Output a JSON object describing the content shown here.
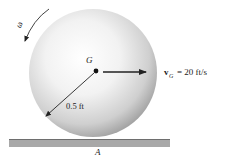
{
  "diagram": {
    "type": "rolling-sphere-kinematics",
    "labels": {
      "omega": "ω",
      "center": "G",
      "radius": "0.5 ft",
      "velocity_symbol": "v",
      "velocity_subscript": "G",
      "velocity_value": "= 20 ft/s",
      "contact_point": "A"
    },
    "colors": {
      "sphere_highlight": "#ffffff",
      "sphere_shadow": "#9a9a9a",
      "ground": "#a8a8a8",
      "ground_edge": "#6e6e6e",
      "arrows": "#222222"
    }
  }
}
